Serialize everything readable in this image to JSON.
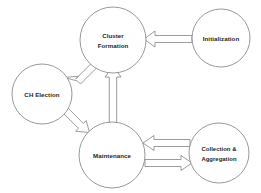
{
  "diagram": {
    "background_color": "#ffffff",
    "node_stroke_color": "#8c8c8c",
    "node_fill_color": "#ffffff",
    "arrow_stroke_color": "#8a8a8a",
    "arrow_fill_color": "#ffffff",
    "text_color": "#231f20",
    "nodes": [
      {
        "id": "cluster-formation",
        "label_line1": "Cluster",
        "label_line2": "Formation",
        "cx": 113,
        "cy": 40,
        "r": 33
      },
      {
        "id": "initialization",
        "label_line1": "Initialization",
        "label_line2": "",
        "cx": 221,
        "cy": 38,
        "r": 29
      },
      {
        "id": "ch-election",
        "label_line1": "CH Election",
        "label_line2": "",
        "cx": 42,
        "cy": 94,
        "r": 30
      },
      {
        "id": "maintenance",
        "label_line1": "Maintenance",
        "label_line2": "",
        "cx": 112,
        "cy": 155,
        "r": 33
      },
      {
        "id": "collection-aggregation",
        "label_line1": "Collection &",
        "label_line2": "Aggregation",
        "cx": 219,
        "cy": 153,
        "r": 30
      }
    ],
    "edges": [
      {
        "id": "initialization-to-cluster-formation",
        "from": "initialization",
        "to": "cluster-formation",
        "direction": "left",
        "style": "hollow-block-arrow"
      },
      {
        "id": "cluster-formation-to-ch-election",
        "from": "cluster-formation",
        "to": "ch-election",
        "direction": "down-left",
        "style": "hollow-block-arrow"
      },
      {
        "id": "ch-election-to-maintenance",
        "from": "ch-election",
        "to": "maintenance",
        "direction": "down-right",
        "style": "hollow-block-arrow"
      },
      {
        "id": "maintenance-to-cluster-formation",
        "from": "maintenance",
        "to": "cluster-formation",
        "direction": "up",
        "style": "hollow-block-arrow"
      },
      {
        "id": "collection-aggregation-to-maintenance",
        "from": "collection-aggregation",
        "to": "maintenance",
        "direction": "left",
        "style": "hollow-block-arrow"
      },
      {
        "id": "maintenance-to-collection-aggregation",
        "from": "maintenance",
        "to": "collection-aggregation",
        "direction": "right",
        "style": "hollow-block-arrow"
      }
    ]
  }
}
